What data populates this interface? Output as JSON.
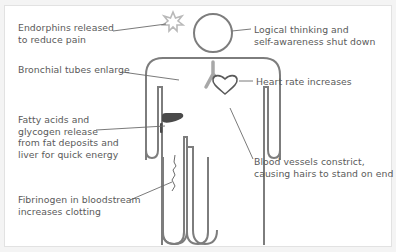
{
  "diagram": {
    "colors": {
      "outline": "#7d7d7d",
      "text": "#5a5a5a",
      "leader": "#6b6b6b",
      "starburst": "#b9b9b9",
      "bronchi": "#a8a8a8",
      "liver": "#4a4a4a",
      "background": "#ffffff"
    },
    "labels": [
      {
        "id": "endorphins",
        "lines": [
          "Endorphins released",
          "to reduce pain"
        ]
      },
      {
        "id": "logical",
        "lines": [
          "Logical thinking and",
          "self-awareness shut down"
        ]
      },
      {
        "id": "bronchial",
        "lines": [
          "Bronchial tubes enlarge"
        ]
      },
      {
        "id": "heart",
        "lines": [
          "Heart rate increases"
        ]
      },
      {
        "id": "fatty",
        "lines": [
          "Fatty acids and",
          "glycogen release",
          "from fat deposits and",
          "liver for quick energy"
        ]
      },
      {
        "id": "blood",
        "lines": [
          "Blood vessels constrict,",
          "causing hairs to stand on end"
        ]
      },
      {
        "id": "fibrinogen",
        "lines": [
          "Fibrinogen in bloodstream",
          "increases clotting"
        ]
      }
    ],
    "figure_parts": [
      "head",
      "starburst",
      "torso",
      "bronchi",
      "heart",
      "liver",
      "arms",
      "legs",
      "clot"
    ]
  }
}
